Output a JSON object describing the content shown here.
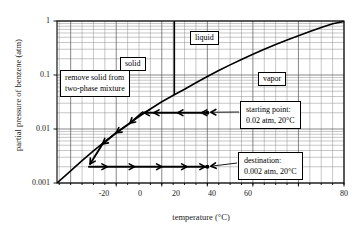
{
  "chart_data": {
    "type": "line",
    "title": "",
    "xlabel": "temperature (°C)",
    "ylabel": "partial pressure of benzene (atm)",
    "xlim": [
      -46,
      80
    ],
    "ylim": [
      0.001,
      1
    ],
    "yscale": "log",
    "grid": true,
    "legend_position": "none",
    "xticks": [
      -20,
      0,
      20,
      40,
      60,
      80
    ],
    "xtick_labels": [
      "-20",
      "0",
      "20",
      "40",
      "60",
      "80"
    ],
    "xminor_tick_step": 5,
    "yticks": [
      1,
      0.1,
      0.01,
      0.001
    ],
    "ytick_labels": [
      "1",
      "0.1",
      "0.01",
      "0.001"
    ],
    "series": [
      {
        "name": "benzene vapor pressure curve",
        "x": [
          -46,
          -40,
          -35,
          -30,
          -25,
          -20,
          -15,
          -10,
          -5,
          0,
          5.5,
          10,
          15,
          20,
          25,
          30,
          35,
          40,
          45,
          50,
          55,
          60,
          65,
          70,
          75,
          80
        ],
        "y": [
          0.001,
          0.00168,
          0.0026,
          0.00395,
          0.00585,
          0.0085,
          0.0121,
          0.017,
          0.0235,
          0.032,
          0.043,
          0.0545,
          0.072,
          0.094,
          0.121,
          0.154,
          0.194,
          0.242,
          0.299,
          0.366,
          0.444,
          0.534,
          0.638,
          0.756,
          0.89,
          0.98
        ]
      }
    ],
    "vertical_line": {
      "name": "melting point line",
      "x": 5.5
    },
    "points": [
      {
        "name": "starting point",
        "x": 20,
        "y": 0.02,
        "label": "starting point:",
        "value_label": "0.02 atm, 20°C"
      },
      {
        "name": "destination",
        "x": 20,
        "y": 0.002,
        "label": "destination:",
        "value_label": "0.002 atm, 20°C"
      }
    ],
    "process_paths": [
      {
        "name": "cooling-along-saturation-path",
        "direction": "leftward-then-down-curve",
        "from": {
          "x": 20,
          "y": 0.02
        },
        "to": {
          "x": -32,
          "y": 0.002
        },
        "pressure_level": 0.02
      },
      {
        "name": "warming-at-constant-pressure-path",
        "direction": "rightward",
        "from": {
          "x": -32,
          "y": 0.002
        },
        "to": {
          "x": 20,
          "y": 0.002
        },
        "pressure_level": 0.002
      }
    ],
    "region_labels": [
      {
        "name": "solid",
        "text": "solid"
      },
      {
        "name": "liquid",
        "text": "liquid"
      },
      {
        "name": "vapor",
        "text": "vapor"
      }
    ],
    "annotations": [
      {
        "name": "remove-solid-note",
        "lines": [
          "remove solid from",
          "two-phase mixture"
        ]
      }
    ]
  },
  "axes": {
    "x_title": "temperature (°C)",
    "y_title": "partial pressure of benzene (atm)",
    "x_tick_labels": [
      "-20",
      "0",
      "20",
      "40",
      "60",
      "80"
    ],
    "y_tick_labels": [
      "1",
      "0.1",
      "0.01",
      "0.001"
    ]
  },
  "regions": {
    "solid": "solid",
    "liquid": "liquid",
    "vapor": "vapor"
  },
  "notes": {
    "remove_solid_line1": "remove solid from",
    "remove_solid_line2": "two-phase mixture"
  },
  "callouts": {
    "start_line1": "starting point:",
    "start_line2": "0.02 atm, 20°C",
    "dest_line1": "destination:",
    "dest_line2": "0.002 atm, 20°C"
  },
  "colors": {
    "curve": "#000000",
    "grid": "#8c8c8c",
    "axis": "#000000",
    "background": "#ffffff",
    "text": "#1a1a1a"
  }
}
